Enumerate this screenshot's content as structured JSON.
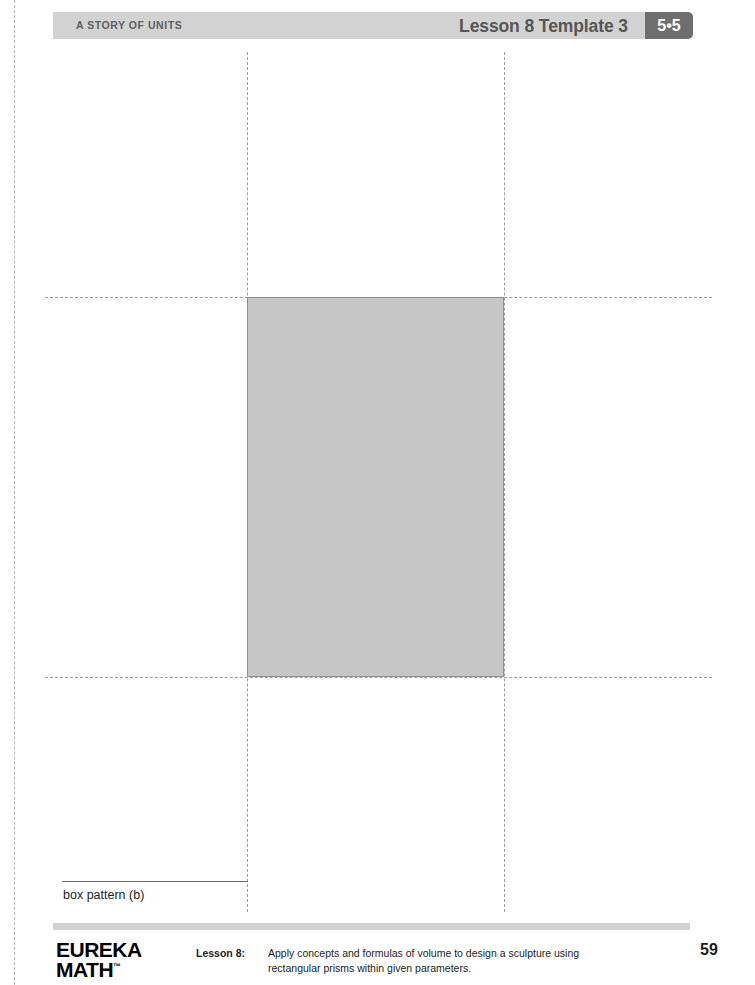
{
  "header": {
    "series_title": "A STORY OF UNITS",
    "lesson_title": "Lesson 8 Template 3",
    "grade_module_badge": "5•5",
    "bar_color": "#d2d2d2",
    "badge_color": "#6e6e6e"
  },
  "worksheet": {
    "caption": "box pattern (b)",
    "shaded_face_fill": "#c6c6c6",
    "shaded_face_stroke": "#8e8e8e",
    "fold_line_color": "#9c9c9c"
  },
  "footer": {
    "logo_line1": "EUREKA",
    "logo_line2": "MATH",
    "logo_trademark": "™",
    "lesson_label": "Lesson 8:",
    "description": "Apply concepts and formulas of volume to design a sculpture using rectangular prisms within given parameters.",
    "page_number": "59",
    "rule_color": "#d2d2d2"
  }
}
